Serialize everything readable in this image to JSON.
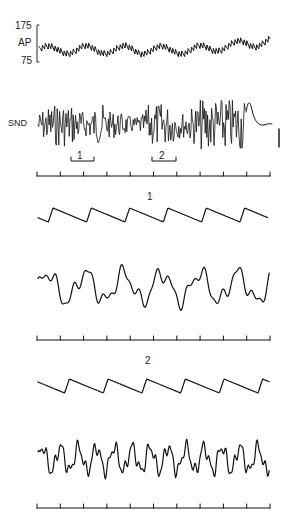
{
  "figure": {
    "top_panel": {
      "ap_label": "AP",
      "ap_scale_max": "175",
      "ap_scale_min": "75",
      "snd_label": "SND",
      "segment_markers": [
        "1",
        "2"
      ]
    },
    "expanded_panels": [
      {
        "title": "1"
      },
      {
        "title": "2"
      }
    ],
    "time_axes": {
      "tick_count": 11,
      "count": 3
    },
    "colors": {
      "trace": "#111111",
      "axis": "#222222",
      "background": "#ffffff"
    }
  }
}
